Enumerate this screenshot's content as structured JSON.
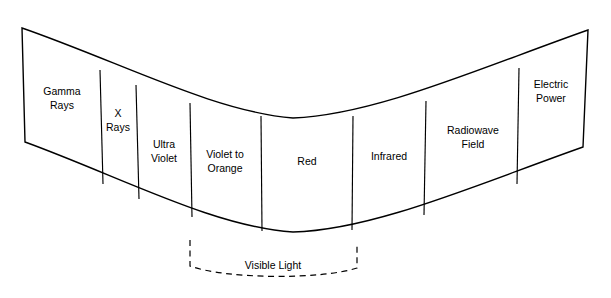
{
  "diagram": {
    "type": "curved-band-segment-diagram",
    "background_color": "#ffffff",
    "line_color": "#000000",
    "bands": [
      {
        "id": "gamma-rays",
        "label_line1": "Gamma",
        "label_line2": "Rays",
        "order": 1
      },
      {
        "id": "x-rays",
        "label_line1": "X",
        "label_line2": "Rays",
        "order": 2
      },
      {
        "id": "ultra-violet",
        "label_line1": "Ultra",
        "label_line2": "Violet",
        "order": 3
      },
      {
        "id": "violet-orange",
        "label_line1": "Violet to",
        "label_line2": "Orange",
        "order": 4
      },
      {
        "id": "red",
        "label_line1": "Red",
        "label_line2": "",
        "order": 5
      },
      {
        "id": "infrared",
        "label_line1": "Infrared",
        "label_line2": "",
        "order": 6
      },
      {
        "id": "radiowave-field",
        "label_line1": "Radiowave",
        "label_line2": "Field",
        "order": 7
      },
      {
        "id": "electric-power",
        "label_line1": "Electric",
        "label_line2": "Power",
        "order": 8
      }
    ],
    "bracket": {
      "id": "visible-light",
      "label": "Visible Light",
      "covers": [
        "violet-orange",
        "red"
      ],
      "style": "dashed"
    }
  }
}
